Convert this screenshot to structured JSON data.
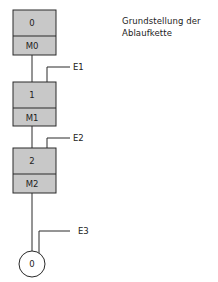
{
  "caption": {
    "line1": "Grundstellung der",
    "line2": "Ablaufkette"
  },
  "colors": {
    "box_fill": "#c8c8c8",
    "stroke": "#2a2a2a",
    "background": "#ffffff"
  },
  "steps": [
    {
      "number": "0",
      "action": "M0"
    },
    {
      "number": "1",
      "action": "M1"
    },
    {
      "number": "2",
      "action": "M2"
    }
  ],
  "transitions": [
    {
      "label": "E1"
    },
    {
      "label": "E2"
    },
    {
      "label": "E3"
    }
  ],
  "end_state": {
    "label": "0"
  }
}
